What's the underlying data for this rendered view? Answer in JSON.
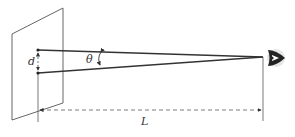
{
  "diagram": {
    "type": "geometry-optics",
    "labels": {
      "separation": "d",
      "angle": "θ",
      "distance": "L"
    },
    "elements": [
      "screen-plane",
      "point-top",
      "point-bottom",
      "ray-top",
      "ray-bottom",
      "eye",
      "distance-arrow"
    ],
    "colors": {
      "line": "#333333",
      "plane": "#555555",
      "eye": "#222222"
    }
  }
}
